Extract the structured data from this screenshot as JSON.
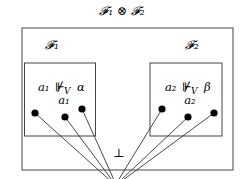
{
  "title": "𝓕₁ ⊗ 𝓕₂",
  "outer_box": {
    "x": 22,
    "y": 28,
    "w": 211,
    "h": 142
  },
  "left_frame": {
    "label": "𝓕₁",
    "box": {
      "x": 24,
      "y": 63,
      "w": 71,
      "h": 73
    },
    "formula": {
      "lhs": "a₁",
      "rel": "⊮",
      "sub": "V",
      "rhs": "α"
    },
    "sub_label": "a₁",
    "dots": [
      {
        "x": 35,
        "y": 113
      },
      {
        "x": 65,
        "y": 117
      },
      {
        "x": 82,
        "y": 109
      }
    ]
  },
  "right_frame": {
    "label": "𝓕₂",
    "box": {
      "x": 150,
      "y": 63,
      "w": 72,
      "h": 73
    },
    "formula": {
      "lhs": "a₂",
      "rel": "⊮",
      "sub": "V",
      "rhs": "β"
    },
    "sub_label": "a₂",
    "dots": [
      {
        "x": 162,
        "y": 109
      },
      {
        "x": 188,
        "y": 117
      },
      {
        "x": 214,
        "y": 113
      }
    ]
  },
  "bottom_symbol": "⊥",
  "convergence_point": {
    "x": 116,
    "y": 183
  },
  "colors": {
    "stroke": "#333333",
    "dot": "#000000",
    "text": "#111111"
  }
}
